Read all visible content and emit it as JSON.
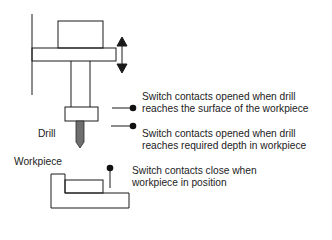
{
  "diagram": {
    "title": "",
    "labels": {
      "drill": "Drill",
      "workpiece": "Workpiece"
    },
    "switches": [
      {
        "line1": "Switch contacts opened when drill",
        "line2": "reaches the surface of the workpiece"
      },
      {
        "line1": "Switch contacts opened when drill",
        "line2": "reaches required depth in workpiece"
      },
      {
        "line1": "Switch contacts close when",
        "line2": "workpiece in position"
      }
    ],
    "icons": {
      "motion": "double-arrow-vertical-icon",
      "contact": "filled-circle-icon"
    },
    "colors": {
      "stroke": "#1a1a1a",
      "drill_bit": "#6e6e6e",
      "background": "#ffffff"
    }
  }
}
